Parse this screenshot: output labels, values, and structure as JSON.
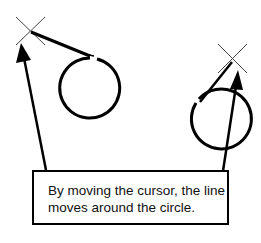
{
  "caption": {
    "line1": "By moving the cursor, the line",
    "line2": "moves around the circle."
  },
  "figures": [
    {
      "name": "left-example",
      "cursor": [
        30,
        31
      ],
      "circle_center": [
        88,
        88
      ],
      "radius": 30
    },
    {
      "name": "right-example",
      "cursor": [
        232,
        75
      ],
      "circle_center": [
        173,
        86
      ],
      "radius": 30
    }
  ],
  "colors": {
    "stroke": "#000000",
    "cursor": "#333333",
    "background": "#ffffff"
  }
}
